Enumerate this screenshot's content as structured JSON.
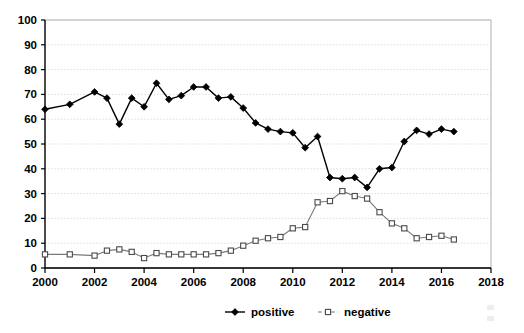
{
  "chart_data": {
    "type": "line",
    "title": "",
    "subtitle": "",
    "xlabel": "",
    "ylabel": "",
    "xlim": [
      2000,
      2018
    ],
    "ylim": [
      0,
      100
    ],
    "x_ticks": [
      2000,
      2002,
      2004,
      2006,
      2008,
      2010,
      2012,
      2014,
      2016,
      2018
    ],
    "y_ticks": [
      0,
      10,
      20,
      30,
      40,
      50,
      60,
      70,
      80,
      90,
      100
    ],
    "grid": "horizontal-dotted",
    "legend_position": "bottom-center",
    "x": [
      2000.0,
      2001.0,
      2002.0,
      2002.5,
      2003.0,
      2003.5,
      2004.0,
      2004.5,
      2005.0,
      2005.5,
      2006.0,
      2006.5,
      2007.0,
      2007.5,
      2008.0,
      2008.5,
      2009.0,
      2009.5,
      2010.0,
      2010.5,
      2011.0,
      2011.5,
      2012.0,
      2012.5,
      2013.0,
      2013.5,
      2014.0,
      2014.5,
      2015.0,
      2015.5,
      2016.0,
      2016.5
    ],
    "series": [
      {
        "name": "positive",
        "marker": "filled-diamond",
        "line_style": "solid",
        "color": "#000000",
        "values": [
          64,
          66,
          71,
          68.5,
          58,
          68.5,
          65,
          74.5,
          68,
          69.5,
          73,
          73,
          68.5,
          69,
          64.5,
          58.5,
          56,
          55,
          54.5,
          48.5,
          53,
          36.5,
          36,
          36.5,
          32.5,
          40,
          40.5,
          51,
          55.5,
          54,
          56,
          55
        ]
      },
      {
        "name": "negative",
        "marker": "open-square",
        "line_style": "solid-thin",
        "color": "#7a7a7a",
        "values": [
          5.5,
          5.5,
          5,
          7,
          7.5,
          6.5,
          4,
          6,
          5.5,
          5.5,
          5.5,
          5.5,
          6,
          7,
          9,
          11,
          12,
          12.5,
          16,
          16.5,
          26.5,
          27,
          31,
          29,
          28,
          22.5,
          18,
          16,
          12,
          12.5,
          13,
          11.5
        ]
      }
    ],
    "legend": [
      {
        "label": "positive",
        "marker": "filled-diamond"
      },
      {
        "label": "negative",
        "marker": "open-square"
      }
    ]
  }
}
